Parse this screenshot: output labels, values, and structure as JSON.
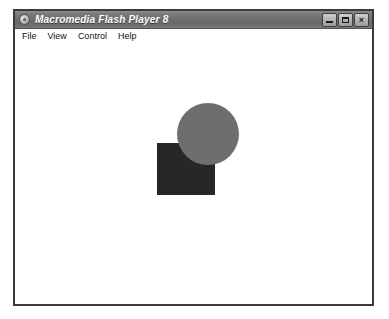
{
  "window": {
    "title": "Macromedia Flash Player 8",
    "icon": "flash-player-icon",
    "controls": [
      {
        "name": "minimize",
        "label": "Minimize",
        "glyph": "_"
      },
      {
        "name": "maximize",
        "label": "Maximize",
        "glyph": "□"
      },
      {
        "name": "close",
        "label": "Close",
        "glyph": "×"
      }
    ]
  },
  "menu": {
    "items": [
      {
        "label": "File"
      },
      {
        "label": "View"
      },
      {
        "label": "Control"
      },
      {
        "label": "Help"
      }
    ]
  },
  "stage": {
    "background_color": "#ffffff",
    "shapes": [
      {
        "name": "square",
        "type": "rectangle",
        "color": "#272727",
        "x": 142,
        "y": 98,
        "width": 58,
        "height": 52,
        "z": 1
      },
      {
        "name": "circle",
        "type": "circle",
        "color": "#6e6e6e",
        "x": 162,
        "y": 58,
        "width": 62,
        "height": 62,
        "z": 2
      }
    ]
  },
  "colors": {
    "titlebar_top": "#8d8d8d",
    "titlebar_bottom": "#777777",
    "window_border": "#3a3a3a",
    "circle": "#6e6e6e",
    "square": "#272727",
    "desktop": "#ffffff"
  }
}
